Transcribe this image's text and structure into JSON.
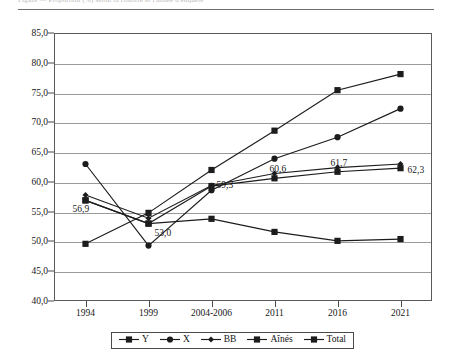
{
  "top_caption": "Figure — Proportion (%) selon la cohorte et l'année d'enquête",
  "chart_data": {
    "type": "line",
    "title": "",
    "subtitle": "",
    "xlabel": "",
    "ylabel": "",
    "grid": true,
    "legend_position": "bottom",
    "ylim": [
      40.0,
      85.0
    ],
    "ytick_step": 5.0,
    "ytick_labels": [
      "85,0",
      "80,0",
      "75,0",
      "70,0",
      "65,0",
      "60,0",
      "55,0",
      "50,0",
      "45,0",
      "40,0"
    ],
    "ytick_values": [
      85.0,
      80.0,
      75.0,
      70.0,
      65.0,
      60.0,
      55.0,
      50.0,
      45.0,
      40.0
    ],
    "categories": [
      "1994",
      "1999",
      "2004-2006",
      "2011",
      "2016",
      "2021"
    ],
    "series": [
      {
        "name": "Y",
        "marker": "square",
        "color": "#1c1c1c",
        "values": [
          49.6,
          54.8,
          62.0,
          68.6,
          75.4,
          78.1
        ]
      },
      {
        "name": "X",
        "marker": "circle",
        "color": "#1c1c1c",
        "values": [
          63.0,
          49.3,
          58.6,
          63.9,
          67.5,
          72.3
        ]
      },
      {
        "name": "BB",
        "marker": "diamond",
        "color": "#1c1c1c",
        "values": [
          57.8,
          53.9,
          59.4,
          61.4,
          62.4,
          63.0
        ]
      },
      {
        "name": "Aînés",
        "marker": "square",
        "color": "#1c1c1c",
        "values": [
          56.9,
          53.0,
          53.8,
          51.6,
          50.1,
          50.4
        ]
      },
      {
        "name": "Total",
        "marker": "square",
        "color": "#1c1c1c",
        "values": [
          56.9,
          53.0,
          59.3,
          60.6,
          61.7,
          62.3
        ]
      }
    ],
    "data_labels": [
      {
        "text": "56,9",
        "category": "1994",
        "value": 56.9
      },
      {
        "text": "53,0",
        "category": "1999",
        "value": 53.0
      },
      {
        "text": "59,3",
        "category": "2004-2006",
        "value": 59.3
      },
      {
        "text": "60,6",
        "category": "2011",
        "value": 60.6
      },
      {
        "text": "61,7",
        "category": "2016",
        "value": 61.7
      },
      {
        "text": "62,3",
        "category": "2021",
        "value": 62.3
      }
    ],
    "legend": [
      {
        "label": "Y",
        "marker": "square"
      },
      {
        "label": "X",
        "marker": "circle"
      },
      {
        "label": "BB",
        "marker": "diamond"
      },
      {
        "label": "Aînés",
        "marker": "square"
      },
      {
        "label": "Total",
        "marker": "square"
      }
    ]
  }
}
